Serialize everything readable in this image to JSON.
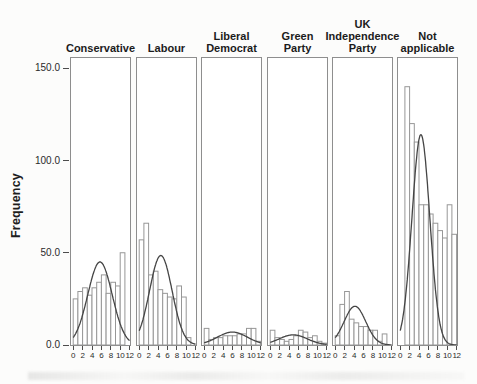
{
  "figure": {
    "ylabel": "Frequency",
    "y_axis": {
      "ticks": [
        {
          "label": "0.0",
          "value": 0
        },
        {
          "label": "50.0",
          "value": 50
        },
        {
          "label": "100.0",
          "value": 100
        },
        {
          "label": "150.0",
          "value": 150
        }
      ]
    },
    "x_axis": {
      "ticks": [
        {
          "label": "0",
          "value": 0
        },
        {
          "label": "2",
          "value": 2
        },
        {
          "label": "4",
          "value": 4
        },
        {
          "label": "6",
          "value": 6
        },
        {
          "label": "8",
          "value": 8
        },
        {
          "label": "10",
          "value": 10
        },
        {
          "label": "12",
          "value": 12
        }
      ]
    }
  },
  "chart_data": {
    "type": "bar",
    "subtype": "faceted-histogram-with-normal-curve",
    "title": "",
    "xlabel": "",
    "ylabel": "Frequency",
    "xlim": [
      0,
      12
    ],
    "ylim": [
      0,
      156
    ],
    "grid": false,
    "bin_width": 1,
    "x_bin_starts": [
      0,
      1,
      2,
      3,
      4,
      5,
      6,
      7,
      8,
      9,
      10,
      11
    ],
    "facets": [
      {
        "label": "Conservative",
        "slug": "conservative",
        "header_lines": [
          "Conservative"
        ],
        "values": [
          25,
          29,
          31,
          27,
          31,
          34,
          38,
          28,
          34,
          32,
          50,
          0
        ],
        "curve": {
          "shape": "normal",
          "peak": 45,
          "mean": 5.7,
          "sd": 2.6
        }
      },
      {
        "label": "Labour",
        "slug": "labour",
        "header_lines": [
          "Labour"
        ],
        "values": [
          57,
          66,
          38,
          40,
          30,
          28,
          26,
          25,
          32,
          26,
          4,
          0
        ],
        "curve": {
          "shape": "normal",
          "peak": 48.5,
          "mean": 4.6,
          "sd": 2.4
        }
      },
      {
        "label": "Liberal Democrat",
        "slug": "liberal-democrat",
        "header_lines": [
          "Liberal",
          "Democrat"
        ],
        "values": [
          9,
          3,
          4,
          4,
          5,
          5,
          5,
          6,
          6,
          9,
          9,
          2
        ],
        "curve": {
          "shape": "normal",
          "peak": 7,
          "mean": 6.0,
          "sd": 3.2
        }
      },
      {
        "label": "Green Party",
        "slug": "green-party",
        "header_lines": [
          "Green",
          "Party"
        ],
        "values": [
          8,
          4,
          3,
          2,
          3,
          5,
          8,
          7,
          4,
          5,
          2,
          1
        ],
        "curve": {
          "shape": "normal",
          "peak": 5.5,
          "mean": 4.9,
          "sd": 3.0
        }
      },
      {
        "label": "UK Independence Party",
        "slug": "uk-independence-party",
        "header_lines": [
          "UK",
          "Independence",
          "Party"
        ],
        "values": [
          5,
          22,
          29,
          14,
          12,
          10,
          10,
          8,
          8,
          2,
          6,
          0
        ],
        "curve": {
          "shape": "normal",
          "peak": 21,
          "mean": 4.2,
          "sd": 2.3
        }
      },
      {
        "label": "Not applicable",
        "slug": "not-applicable",
        "header_lines": [
          "Not",
          "applicable"
        ],
        "values": [
          0,
          140,
          120,
          110,
          76,
          76,
          71,
          66,
          62,
          58,
          76,
          60
        ],
        "curve": {
          "shape": "normal",
          "peak": 114,
          "mean": 4.4,
          "sd": 1.9
        }
      }
    ],
    "style": {
      "bar_fill": "#ffffff",
      "bar_stroke": "#979797",
      "curve_color": "#454545",
      "panel_border": "#8e8e8e",
      "text_color": "#1b1b1b"
    }
  }
}
